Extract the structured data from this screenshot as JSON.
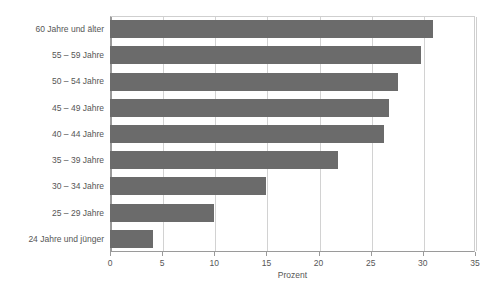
{
  "chart_data": {
    "type": "bar",
    "orientation": "horizontal",
    "title": "",
    "subtitle": "",
    "xlabel": "Prozent",
    "ylabel": "",
    "xlim": [
      0,
      35
    ],
    "xticks": [
      0,
      5,
      10,
      15,
      20,
      25,
      30,
      35
    ],
    "xtick_labels": [
      "0",
      "5",
      "10",
      "15",
      "20",
      "25",
      "30",
      "35"
    ],
    "grid": true,
    "legend": null,
    "bar_color": "#6b6b6b",
    "categories": [
      "60 Jahre und älter",
      "55 – 59 Jahre",
      "50 – 54 Jahre",
      "45 – 49 Jahre",
      "40 – 44 Jahre",
      "35 – 39 Jahre",
      "30 – 34 Jahre",
      "25 – 29 Jahre",
      "24 Jahre und jünger"
    ],
    "values": [
      31.0,
      29.8,
      27.6,
      26.8,
      26.3,
      21.9,
      15.0,
      10.0,
      4.1
    ],
    "bars": [
      {
        "category": "60 Jahre und älter",
        "value": 31.0
      },
      {
        "category": "55 – 59 Jahre",
        "value": 29.8
      },
      {
        "category": "50 – 54 Jahre",
        "value": 27.6
      },
      {
        "category": "45 – 49 Jahre",
        "value": 26.8
      },
      {
        "category": "40 – 44 Jahre",
        "value": 26.3
      },
      {
        "category": "35 – 39 Jahre",
        "value": 21.9
      },
      {
        "category": "30 – 34 Jahre",
        "value": 15.0
      },
      {
        "category": "25 – 29 Jahre",
        "value": 10.0
      },
      {
        "category": "24 Jahre und jünger",
        "value": 4.1
      }
    ]
  },
  "colors": {
    "bar": "#6b6b6b",
    "grid": "#d2d2d2",
    "axis": "#9a9a9a",
    "text": "#565656",
    "background": "#ffffff"
  }
}
